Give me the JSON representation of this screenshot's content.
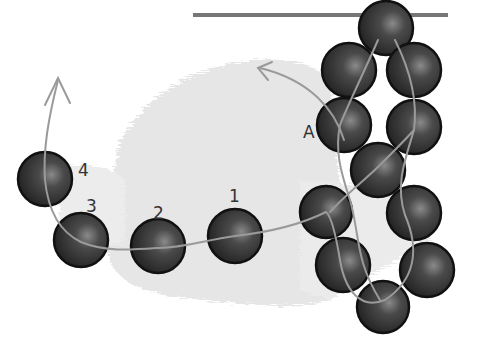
{
  "diagram": {
    "type": "beading-instruction",
    "colors": {
      "background": "#ffffff",
      "smudge": "#e4e4e4",
      "bar": "#777777",
      "bead_dark": "#262626",
      "bead_mid": "#4a4a4a",
      "bead_highlight": "#8a8a8a",
      "bead_outline": "#111111",
      "thread": "#9a9a9a"
    },
    "labels": {
      "bead_1": "1",
      "bead_2": "2",
      "bead_3": "3",
      "bead_4": "4",
      "bead_a": "A"
    },
    "bar": {
      "x1": 193,
      "y1": 15,
      "x2": 448,
      "y2": 15
    },
    "cluster_beads": [
      {
        "id": "top",
        "cx": 386,
        "cy": 28,
        "r": 27
      },
      {
        "id": "upper-left",
        "cx": 349,
        "cy": 70,
        "r": 27
      },
      {
        "id": "upper-right",
        "cx": 414,
        "cy": 70,
        "r": 27
      },
      {
        "id": "a",
        "cx": 344,
        "cy": 125,
        "r": 27
      },
      {
        "id": "mid-right",
        "cx": 414,
        "cy": 127,
        "r": 27
      },
      {
        "id": "center",
        "cx": 378,
        "cy": 170,
        "r": 27
      },
      {
        "id": "lower-left-a",
        "cx": 326,
        "cy": 212,
        "r": 26
      },
      {
        "id": "lower-right-a",
        "cx": 414,
        "cy": 213,
        "r": 27
      },
      {
        "id": "lower-left-b",
        "cx": 343,
        "cy": 265,
        "r": 27
      },
      {
        "id": "lower-right-b",
        "cx": 427,
        "cy": 270,
        "r": 27
      },
      {
        "id": "bottom",
        "cx": 383,
        "cy": 307,
        "r": 26
      }
    ],
    "chain_beads": [
      {
        "id": "bead-1",
        "cx": 235,
        "cy": 236,
        "r": 27,
        "label": "1",
        "lx": 229,
        "ly": 200
      },
      {
        "id": "bead-2",
        "cx": 158,
        "cy": 246,
        "r": 27,
        "label": "2",
        "lx": 153,
        "ly": 218
      },
      {
        "id": "bead-3",
        "cx": 81,
        "cy": 240,
        "r": 27,
        "label": "3",
        "lx": 88,
        "ly": 211
      },
      {
        "id": "bead-4",
        "cx": 45,
        "cy": 179,
        "r": 27,
        "label": "4",
        "lx": 79,
        "ly": 174
      }
    ]
  }
}
